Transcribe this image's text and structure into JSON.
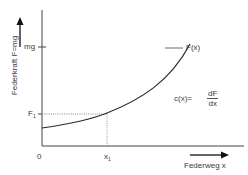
{
  "diagram": {
    "y_axis_label": "Federkraft  F=mg",
    "x_axis_label": "Federweg  x",
    "origin_label": "0",
    "y_ticks": [
      {
        "label": "mg"
      },
      {
        "label": "F",
        "subscript": "1"
      }
    ],
    "x_ticks": [
      {
        "label": "x",
        "subscript": "1"
      }
    ],
    "curve_label": "F(x)",
    "formula": {
      "lhs": "c(x)=",
      "numerator": "dF",
      "denominator": "dx"
    },
    "colors": {
      "line": "#2a2a2a",
      "dotted": "#777777",
      "text": "#3a3a3a"
    }
  }
}
